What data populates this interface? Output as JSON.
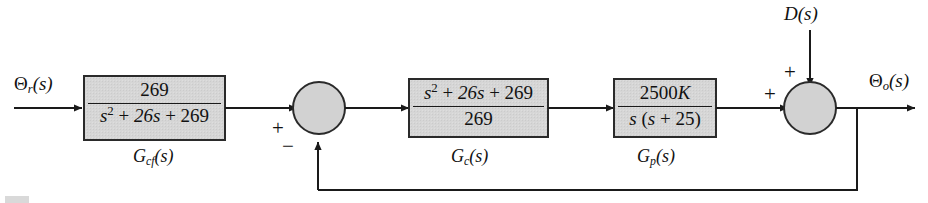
{
  "diagram": {
    "type": "control-system-block-diagram",
    "colors": {
      "block_fill": "#d6d6d6",
      "block_border": "#2a2a2a",
      "line": "#1a1a1a",
      "text": "#111111",
      "junction_fill": "#d2d2d2",
      "background": "#ffffff"
    },
    "input_signal": "Θr(s)",
    "disturbance_signal": "D(s)",
    "output_signal": "Θo(s)",
    "blocks": [
      {
        "id": "gcf",
        "sublabel": "Gcf(s)",
        "numerator": "269",
        "denominator": "s2 + 26s + 269"
      },
      {
        "id": "gc",
        "sublabel": "Gc(s)",
        "numerator": "s2 + 26s + 269",
        "denominator": "269"
      },
      {
        "id": "gp",
        "sublabel": "Gp(s)",
        "numerator": "2500K",
        "denominator": "s (s + 25)"
      }
    ],
    "junctions": [
      {
        "id": "sum-1",
        "signs": {
          "input": "+",
          "feedback": "−"
        }
      },
      {
        "id": "sum-2",
        "signs": {
          "input": "+",
          "disturbance": "+"
        }
      }
    ],
    "feedback": {
      "path": "unity-negative-feedback"
    }
  }
}
